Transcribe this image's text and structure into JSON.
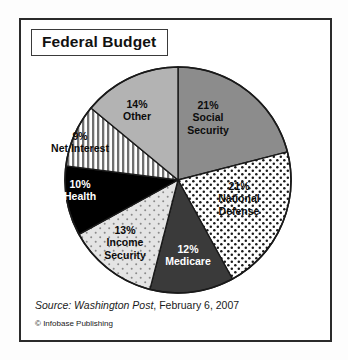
{
  "title": "Federal Budget",
  "footer": {
    "source_prefix": "Source:",
    "source_publication": "Washington Post",
    "source_date": ", February 6, 2007",
    "credit_mark": "©",
    "credit": "Infobase Publishing"
  },
  "chart_data": {
    "type": "pie",
    "title": "Federal Budget",
    "xlabel": "",
    "ylabel": "",
    "units": "percent",
    "total": 100,
    "start_angle_deg": 0,
    "direction": "clockwise",
    "legend": "none (labels drawn inside slices)",
    "grid": false,
    "categories": [
      "Social Security",
      "National Defense",
      "Medicare",
      "Income Security",
      "Health",
      "Net Interest",
      "Other"
    ],
    "values": [
      21,
      21,
      12,
      13,
      10,
      9,
      14
    ],
    "slices": [
      {
        "name": "Social Security",
        "label_pct": "21%",
        "label_line1": "Social",
        "label_line2": "Security",
        "value": 21,
        "start_deg": 0,
        "end_deg": 75.6,
        "fill": "#8c8c8c",
        "pattern": "solid",
        "text_color": "#0c0c0c"
      },
      {
        "name": "National Defense",
        "label_pct": "21%",
        "label_line1": "National",
        "label_line2": "Defense",
        "value": 21,
        "start_deg": 75.6,
        "end_deg": 151.2,
        "fill": "#ffffff",
        "pattern": "dense-dots",
        "text_color": "#0c0c0c"
      },
      {
        "name": "Medicare",
        "label_pct": "12%",
        "label_line1": "Medicare",
        "label_line2": "",
        "value": 12,
        "start_deg": 151.2,
        "end_deg": 194.4,
        "fill": "#3a3a3a",
        "pattern": "solid",
        "text_color": "#ffffff"
      },
      {
        "name": "Income Security",
        "label_pct": "13%",
        "label_line1": "Income",
        "label_line2": "Security",
        "value": 13,
        "start_deg": 194.4,
        "end_deg": 241.2,
        "fill": "#e2e2e2",
        "pattern": "sparse-dots",
        "text_color": "#0c0c0c"
      },
      {
        "name": "Health",
        "label_pct": "10%",
        "label_line1": "Health",
        "label_line2": "",
        "value": 10,
        "start_deg": 241.2,
        "end_deg": 277.2,
        "fill": "#000000",
        "pattern": "solid",
        "text_color": "#ffffff"
      },
      {
        "name": "Net Interest",
        "label_pct": "9%",
        "label_line1": "Net Interest",
        "label_line2": "",
        "value": 9,
        "start_deg": 277.2,
        "end_deg": 309.6,
        "fill": "#ffffff",
        "pattern": "vertical-stripes",
        "text_color": "#0c0c0c"
      },
      {
        "name": "Other",
        "label_pct": "14%",
        "label_line1": "Other",
        "label_line2": "",
        "value": 14,
        "start_deg": 309.6,
        "end_deg": 360,
        "fill": "#b3b3b3",
        "pattern": "solid",
        "text_color": "#0c0c0c"
      }
    ]
  },
  "colors": {
    "frame": "#2b2b2b",
    "background": "#ffffff",
    "text": "#111111",
    "outline": "#1a1a1a"
  }
}
